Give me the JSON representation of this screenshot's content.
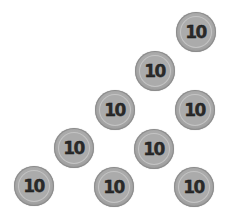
{
  "coins": [
    {
      "value": "10",
      "x": 176,
      "y": 12
    },
    {
      "value": "10",
      "x": 135,
      "y": 51
    },
    {
      "value": "10",
      "x": 95,
      "y": 90
    },
    {
      "value": "10",
      "x": 175,
      "y": 90
    },
    {
      "value": "10",
      "x": 54,
      "y": 128
    },
    {
      "value": "10",
      "x": 134,
      "y": 129
    },
    {
      "value": "10",
      "x": 14,
      "y": 166
    },
    {
      "value": "10",
      "x": 94,
      "y": 167
    },
    {
      "value": "10",
      "x": 174,
      "y": 167
    }
  ],
  "colors": {
    "coin_fill": "#a9a9a9",
    "coin_text": "#2a2a2a",
    "background": "#ffffff"
  }
}
